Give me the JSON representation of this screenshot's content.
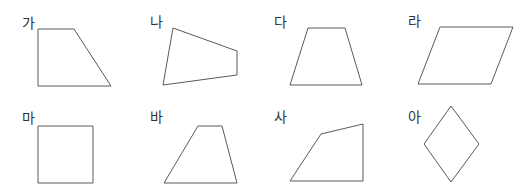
{
  "diagram": {
    "stroke_color": "#5a5a5a",
    "label_color": "#333333",
    "figures": [
      {
        "label": "가",
        "label_pos": [
          22,
          16
        ],
        "shape": "trapezoid-right-angled",
        "points": "38,29 74,29 111,86 38,86"
      },
      {
        "label": "나",
        "label_pos": [
          150,
          15
        ],
        "shape": "quadrilateral",
        "points": "173,28 237,51 237,75 163,85"
      },
      {
        "label": "다",
        "label_pos": [
          274,
          15
        ],
        "shape": "trapezoid-isosceles",
        "points": "308,28 345,28 362,85 290,85"
      },
      {
        "label": "라",
        "label_pos": [
          408,
          14
        ],
        "shape": "parallelogram",
        "points": "440,27 513,27 491,84 418,84"
      },
      {
        "label": "마",
        "label_pos": [
          22,
          111
        ],
        "shape": "square",
        "points": "38,126 93,126 93,183 38,183"
      },
      {
        "label": "바",
        "label_pos": [
          150,
          110
        ],
        "shape": "trapezoid",
        "points": "198,126 222,126 237,183 164,183"
      },
      {
        "label": "사",
        "label_pos": [
          274,
          110
        ],
        "shape": "quadrilateral",
        "points": "290,181 321,134 363,124 363,181"
      },
      {
        "label": "아",
        "label_pos": [
          408,
          110
        ],
        "shape": "rhombus",
        "points": "451,106 479,144 451,182 424,144"
      }
    ]
  }
}
